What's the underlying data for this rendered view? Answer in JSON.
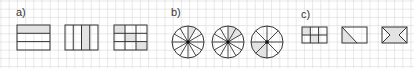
{
  "labels": {
    "a": "a)",
    "b": "b)",
    "c": "c)"
  },
  "colors": {
    "grid": "#d9d9d9",
    "stroke": "#333333",
    "shade": "#e3e3e3"
  },
  "figures": {
    "a": [
      {
        "type": "rect-rows",
        "rows": 3,
        "shaded": [
          0
        ]
      },
      {
        "type": "rect-cols",
        "cols": 4,
        "shaded": [
          2
        ]
      },
      {
        "type": "rect-grid",
        "rows": 3,
        "cols": 3,
        "shaded": [
          [
            0,
            0
          ],
          [
            1,
            1
          ],
          [
            2,
            2
          ]
        ]
      }
    ],
    "b": [
      {
        "type": "circle-sectors",
        "sectors": 12,
        "shaded": 1
      },
      {
        "type": "circle-sectors",
        "sectors": 12,
        "shaded": 2
      },
      {
        "type": "circle-sectors",
        "sectors": 8,
        "shaded": 2
      }
    ],
    "c": [
      {
        "type": "rect-grid",
        "rows": 2,
        "cols": 3,
        "shaded": [
          [
            0,
            0
          ],
          [
            1,
            1
          ]
        ]
      },
      {
        "type": "rect-diagonal",
        "shaded": "lower-left-triangle"
      },
      {
        "type": "rect-envelope",
        "shaded": "hourglass"
      }
    ]
  }
}
